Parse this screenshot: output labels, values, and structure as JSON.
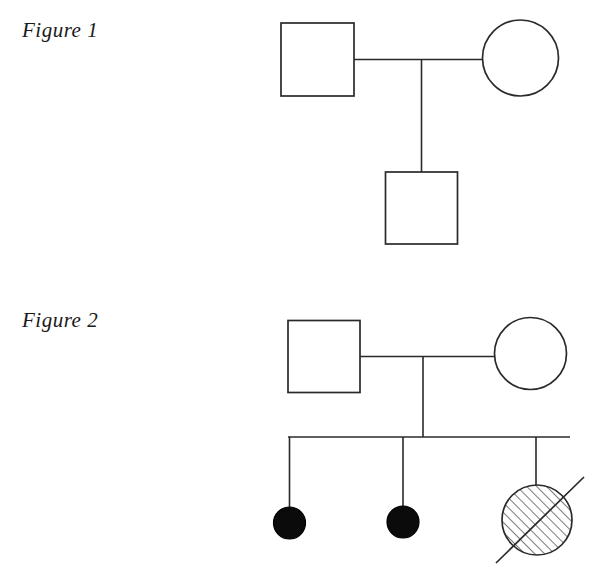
{
  "page": {
    "width": 606,
    "height": 579,
    "background": "#ffffff",
    "ink_color": "#2a2a2a",
    "fill_color": "#0b0b0b"
  },
  "figures": [
    {
      "id": "figure-1",
      "label": "Figure 1",
      "label_x": 22,
      "label_y": 18,
      "generations": 2,
      "individuals": [
        {
          "id": "f1-father",
          "symbol": "square",
          "sex": "male",
          "status": "unaffected",
          "fill": "open",
          "deceased": false,
          "generation": 1,
          "cx": 317.5,
          "cy": 59.5,
          "size": 73
        },
        {
          "id": "f1-mother",
          "symbol": "circle",
          "sex": "female",
          "status": "unaffected",
          "fill": "open",
          "deceased": false,
          "generation": 1,
          "cx": 520.5,
          "cy": 58,
          "size": 76
        },
        {
          "id": "f1-son",
          "symbol": "square",
          "sex": "male",
          "status": "unaffected",
          "fill": "open",
          "deceased": false,
          "generation": 2,
          "cx": 421.5,
          "cy": 208,
          "size": 72
        }
      ],
      "connections": [
        {
          "id": "f1-marriage-line",
          "type": "mating-line",
          "x1": 354,
          "y1": 59.5,
          "x2": 483,
          "y2": 59.5
        },
        {
          "id": "f1-descent-line",
          "type": "descent-line",
          "x1": 421.5,
          "y1": 59.5,
          "x2": 421.5,
          "y2": 172
        }
      ]
    },
    {
      "id": "figure-2",
      "label": "Figure 2",
      "label_x": 22,
      "label_y": 308,
      "generations": 2,
      "individuals": [
        {
          "id": "f2-father",
          "symbol": "square",
          "sex": "male",
          "status": "unaffected",
          "fill": "open",
          "deceased": false,
          "generation": 1,
          "cx": 324,
          "cy": 356.5,
          "size": 72
        },
        {
          "id": "f2-mother",
          "symbol": "circle",
          "sex": "female",
          "status": "unaffected",
          "fill": "open",
          "deceased": false,
          "generation": 1,
          "cx": 530.5,
          "cy": 353.5,
          "size": 72
        },
        {
          "id": "f2-daughter-1",
          "symbol": "circle",
          "sex": "female",
          "status": "affected",
          "fill": "solid",
          "deceased": false,
          "generation": 2,
          "cx": 289.5,
          "cy": 523,
          "size": 32
        },
        {
          "id": "f2-daughter-2",
          "symbol": "circle",
          "sex": "female",
          "status": "affected",
          "fill": "solid",
          "deceased": false,
          "generation": 2,
          "cx": 403,
          "cy": 522,
          "size": 32
        },
        {
          "id": "f2-daughter-3",
          "symbol": "circle",
          "sex": "female",
          "status": "carrier-hatched",
          "fill": "hatched",
          "deceased": true,
          "generation": 2,
          "cx": 537,
          "cy": 520,
          "size": 70
        }
      ],
      "connections": [
        {
          "id": "f2-marriage-line",
          "type": "mating-line",
          "x1": 360,
          "y1": 356.5,
          "x2": 495,
          "y2": 356.5
        },
        {
          "id": "f2-descent-line",
          "type": "descent-line",
          "x1": 423,
          "y1": 356.5,
          "x2": 423,
          "y2": 437
        },
        {
          "id": "f2-sibship-line",
          "type": "sibship-line",
          "x1": 288,
          "y1": 437,
          "x2": 570,
          "y2": 437
        },
        {
          "id": "f2-sib-drop-1",
          "type": "sibling-drop-line",
          "x1": 289.5,
          "y1": 437,
          "x2": 289.5,
          "y2": 507
        },
        {
          "id": "f2-sib-drop-2",
          "type": "sibling-drop-line",
          "x1": 403,
          "y1": 437,
          "x2": 403,
          "y2": 506
        },
        {
          "id": "f2-sib-drop-3",
          "type": "sibling-drop-line",
          "x1": 536,
          "y1": 437,
          "x2": 536,
          "y2": 486
        }
      ],
      "deceased_slash": {
        "id": "f2-deceased-slash",
        "x1": 496,
        "y1": 563,
        "x2": 584,
        "y2": 477
      }
    }
  ],
  "hatch": {
    "angle_degrees": 45,
    "spacing": 7,
    "direction": "lower-left-to-upper-right"
  }
}
